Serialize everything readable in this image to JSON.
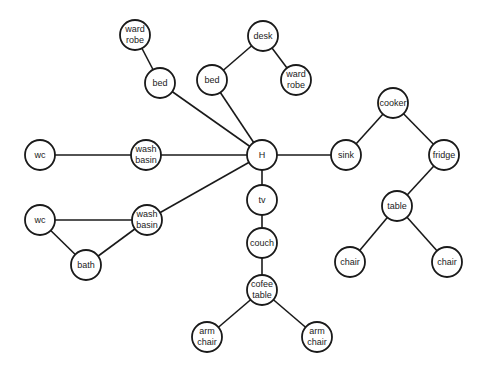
{
  "diagram": {
    "type": "graph",
    "colors": {
      "stroke": "#1a1a1a",
      "fill": "#ffffff",
      "text": "#222222"
    },
    "node_radius": 15,
    "nodes": [
      {
        "id": "wardrobe1",
        "label": "ward robe",
        "lines": [
          "ward",
          "robe"
        ],
        "x": 135,
        "y": 35
      },
      {
        "id": "bed1",
        "label": "bed",
        "lines": [
          "bed"
        ],
        "x": 160,
        "y": 83
      },
      {
        "id": "desk",
        "label": "desk",
        "lines": [
          "desk"
        ],
        "x": 263,
        "y": 36
      },
      {
        "id": "bed2",
        "label": "bed",
        "lines": [
          "bed"
        ],
        "x": 212,
        "y": 80
      },
      {
        "id": "wardrobe2",
        "label": "ward robe",
        "lines": [
          "ward",
          "robe"
        ],
        "x": 296,
        "y": 80
      },
      {
        "id": "H",
        "label": "H",
        "lines": [
          "H"
        ],
        "x": 262,
        "y": 155
      },
      {
        "id": "wc1",
        "label": "wc",
        "lines": [
          "wc"
        ],
        "x": 40,
        "y": 155
      },
      {
        "id": "washbasin1",
        "label": "wash basin",
        "lines": [
          "wash",
          "basin"
        ],
        "x": 146,
        "y": 155
      },
      {
        "id": "sink",
        "label": "sink",
        "lines": [
          "sink"
        ],
        "x": 346,
        "y": 155
      },
      {
        "id": "cooker",
        "label": "cooker",
        "lines": [
          "cooker"
        ],
        "x": 393,
        "y": 103
      },
      {
        "id": "fridge",
        "label": "fridge",
        "lines": [
          "fridge"
        ],
        "x": 444,
        "y": 155
      },
      {
        "id": "tv",
        "label": "tv",
        "lines": [
          "tv"
        ],
        "x": 262,
        "y": 200
      },
      {
        "id": "wc2",
        "label": "wc",
        "lines": [
          "wc"
        ],
        "x": 40,
        "y": 220
      },
      {
        "id": "washbasin2",
        "label": "wash basin",
        "lines": [
          "wash",
          "basin"
        ],
        "x": 147,
        "y": 220
      },
      {
        "id": "bath",
        "label": "bath",
        "lines": [
          "bath"
        ],
        "x": 86,
        "y": 265
      },
      {
        "id": "couch",
        "label": "couch",
        "lines": [
          "couch"
        ],
        "x": 262,
        "y": 243
      },
      {
        "id": "cofeetable",
        "label": "cofee table",
        "lines": [
          "cofee",
          "table"
        ],
        "x": 262,
        "y": 290
      },
      {
        "id": "table",
        "label": "table",
        "lines": [
          "table"
        ],
        "x": 397,
        "y": 206
      },
      {
        "id": "chair1",
        "label": "chair",
        "lines": [
          "chair"
        ],
        "x": 350,
        "y": 262
      },
      {
        "id": "chair2",
        "label": "chair",
        "lines": [
          "chair"
        ],
        "x": 447,
        "y": 262
      },
      {
        "id": "armchair1",
        "label": "arm chair",
        "lines": [
          "arm",
          "chair"
        ],
        "x": 207,
        "y": 337
      },
      {
        "id": "armchair2",
        "label": "arm chair",
        "lines": [
          "arm",
          "chair"
        ],
        "x": 317,
        "y": 337
      }
    ],
    "edges": [
      [
        "wardrobe1",
        "bed1"
      ],
      [
        "bed1",
        "H"
      ],
      [
        "desk",
        "bed2"
      ],
      [
        "desk",
        "wardrobe2"
      ],
      [
        "bed2",
        "H"
      ],
      [
        "wc1",
        "washbasin1"
      ],
      [
        "washbasin1",
        "H"
      ],
      [
        "H",
        "sink"
      ],
      [
        "sink",
        "cooker"
      ],
      [
        "cooker",
        "fridge"
      ],
      [
        "fridge",
        "table"
      ],
      [
        "table",
        "chair1"
      ],
      [
        "table",
        "chair2"
      ],
      [
        "H",
        "washbasin2"
      ],
      [
        "wc2",
        "washbasin2"
      ],
      [
        "wc2",
        "bath"
      ],
      [
        "bath",
        "washbasin2"
      ],
      [
        "H",
        "tv"
      ],
      [
        "tv",
        "couch"
      ],
      [
        "couch",
        "cofeetable"
      ],
      [
        "cofeetable",
        "armchair1"
      ],
      [
        "cofeetable",
        "armchair2"
      ]
    ]
  }
}
